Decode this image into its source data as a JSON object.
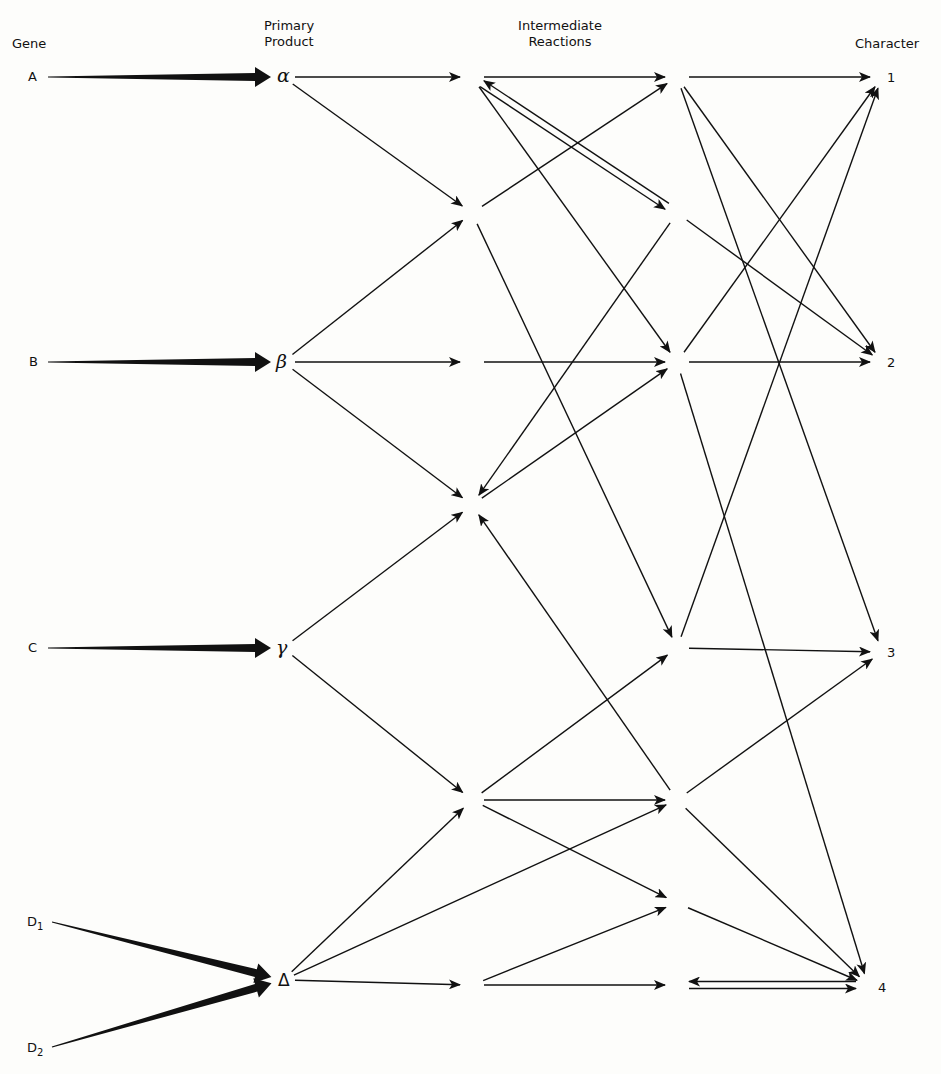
{
  "headers": {
    "gene": "Gene",
    "primary_product_line1": "Primary",
    "primary_product_line2": "Product",
    "intermediate_line1": "Intermediate",
    "intermediate_line2": "Reactions",
    "character": "Character"
  },
  "genes": [
    {
      "id": "A",
      "label": "A"
    },
    {
      "id": "B",
      "label": "B"
    },
    {
      "id": "C",
      "label": "C"
    },
    {
      "id": "D1",
      "label": "D",
      "sub": "1"
    },
    {
      "id": "D2",
      "label": "D",
      "sub": "2"
    }
  ],
  "primary_products": [
    {
      "id": "alpha",
      "label": "α"
    },
    {
      "id": "beta",
      "label": "β"
    },
    {
      "id": "gamma",
      "label": "γ"
    },
    {
      "id": "delta",
      "label": "Δ"
    }
  ],
  "characters": [
    {
      "id": "1",
      "label": "1"
    },
    {
      "id": "2",
      "label": "2"
    },
    {
      "id": "3",
      "label": "3"
    },
    {
      "id": "4",
      "label": "4"
    }
  ],
  "nodes": {
    "A": [
      48,
      77
    ],
    "B": [
      48,
      362
    ],
    "C": [
      48,
      648
    ],
    "D1": [
      52,
      922
    ],
    "D2": [
      52,
      1047
    ],
    "alpha": [
      283,
      77
    ],
    "beta": [
      283,
      362
    ],
    "gamma": [
      283,
      648
    ],
    "delta": [
      283,
      980
    ],
    "I1a": [
      472,
      77
    ],
    "I1b": [
      472,
      213
    ],
    "I1c": [
      472,
      362
    ],
    "I1d": [
      472,
      505
    ],
    "I1e": [
      472,
      800
    ],
    "I1f": [
      472,
      985
    ],
    "I2a": [
      677,
      77
    ],
    "I2b": [
      677,
      213
    ],
    "I2c": [
      677,
      362
    ],
    "I2d": [
      677,
      648
    ],
    "I2e": [
      677,
      800
    ],
    "I2f": [
      677,
      903
    ],
    "I2g": [
      677,
      985
    ],
    "C1": [
      882,
      77
    ],
    "C2": [
      882,
      362
    ],
    "C3": [
      882,
      652
    ],
    "C4": [
      868,
      985
    ]
  },
  "thick_edges": [
    [
      "A",
      "alpha"
    ],
    [
      "B",
      "beta"
    ],
    [
      "C",
      "gamma"
    ],
    [
      "D1",
      "delta"
    ],
    [
      "D2",
      "delta"
    ]
  ],
  "edges": [
    [
      "alpha",
      "I1a"
    ],
    [
      "alpha",
      "I1b"
    ],
    [
      "beta",
      "I1b"
    ],
    [
      "beta",
      "I1c"
    ],
    [
      "beta",
      "I1d"
    ],
    [
      "gamma",
      "I1d"
    ],
    [
      "gamma",
      "I1e"
    ],
    [
      "delta",
      "I1e"
    ],
    [
      "delta",
      "I2e"
    ],
    [
      "delta",
      "I1f"
    ],
    [
      "I1a",
      "I2a"
    ],
    [
      "I1a",
      "I2b"
    ],
    [
      "I2b",
      "I1a"
    ],
    [
      "I1a",
      "I2c"
    ],
    [
      "I1b",
      "I2a"
    ],
    [
      "I1b",
      "I2d"
    ],
    [
      "I1c",
      "I2c"
    ],
    [
      "I2b",
      "I1d"
    ],
    [
      "I1d",
      "I2c"
    ],
    [
      "I2e",
      "I1d"
    ],
    [
      "I1e",
      "I2d"
    ],
    [
      "I1e",
      "I2e"
    ],
    [
      "I1e",
      "I2f"
    ],
    [
      "I1f",
      "I2f"
    ],
    [
      "I1f",
      "I2g"
    ],
    [
      "I2a",
      "C1"
    ],
    [
      "I2a",
      "C2"
    ],
    [
      "I2a",
      "C3"
    ],
    [
      "I2b",
      "C2"
    ],
    [
      "I2c",
      "C1"
    ],
    [
      "I2c",
      "C2"
    ],
    [
      "I2c",
      "C4"
    ],
    [
      "I2d",
      "C1"
    ],
    [
      "I2d",
      "C3"
    ],
    [
      "I2e",
      "C3"
    ],
    [
      "I2e",
      "C4"
    ],
    [
      "I2f",
      "C4"
    ],
    [
      "I2g",
      "C4"
    ],
    [
      "C4",
      "I2g"
    ]
  ],
  "colors": {
    "ink": "#111111",
    "paper": "#fdfdfb"
  }
}
